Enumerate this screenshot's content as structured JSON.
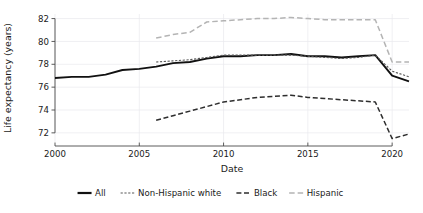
{
  "chart_data": {
    "type": "line",
    "title": "",
    "xlabel": "Date",
    "ylabel": "Life expectancy (years)",
    "xlim": [
      2000,
      2021
    ],
    "ylim": [
      71.2,
      82.4
    ],
    "xticks": [
      2000,
      2005,
      2010,
      2015,
      2020
    ],
    "xtick_labels": [
      "2000",
      "2005",
      "2010",
      "2015",
      "2020"
    ],
    "yticks": [
      72,
      74,
      76,
      78,
      80,
      82
    ],
    "ytick_labels": [
      "72",
      "74",
      "76",
      "78",
      "80",
      "82"
    ],
    "grid": "y-gridlines-light",
    "legend_position": "below-axis-centered",
    "series": [
      {
        "name": "All",
        "color": "#111111",
        "width": 1.9,
        "dash": "none",
        "x": [
          2000,
          2001,
          2002,
          2003,
          2004,
          2005,
          2006,
          2007,
          2008,
          2009,
          2010,
          2011,
          2012,
          2013,
          2014,
          2015,
          2016,
          2017,
          2018,
          2019,
          2020,
          2021
        ],
        "values": [
          76.8,
          76.9,
          76.9,
          77.1,
          77.5,
          77.6,
          77.8,
          78.1,
          78.2,
          78.5,
          78.7,
          78.7,
          78.8,
          78.8,
          78.9,
          78.7,
          78.7,
          78.6,
          78.7,
          78.8,
          77.0,
          76.5
        ]
      },
      {
        "name": "Non-Hispanic white",
        "color": "#585858",
        "width": 1.1,
        "dash": "2.2 1.6",
        "x": [
          2006,
          2007,
          2008,
          2009,
          2010,
          2011,
          2012,
          2013,
          2014,
          2015,
          2016,
          2017,
          2018,
          2019,
          2020,
          2021
        ],
        "values": [
          78.2,
          78.3,
          78.4,
          78.6,
          78.8,
          78.8,
          78.8,
          78.8,
          78.8,
          78.7,
          78.6,
          78.5,
          78.6,
          78.8,
          77.4,
          76.9
        ]
      },
      {
        "name": "Black",
        "color": "#2e2e2e",
        "width": 1.5,
        "dash": "5 2.6",
        "x": [
          2006,
          2007,
          2008,
          2009,
          2010,
          2011,
          2012,
          2013,
          2014,
          2015,
          2016,
          2017,
          2018,
          2019,
          2020,
          2021
        ],
        "values": [
          73.1,
          73.5,
          73.9,
          74.3,
          74.7,
          74.9,
          75.1,
          75.2,
          75.3,
          75.1,
          75.0,
          74.9,
          74.8,
          74.7,
          71.5,
          71.9
        ]
      },
      {
        "name": "Hispanic",
        "color": "#b4b4b4",
        "width": 1.5,
        "dash": "5.5 3",
        "x": [
          2006,
          2007,
          2008,
          2009,
          2010,
          2011,
          2012,
          2013,
          2014,
          2015,
          2016,
          2017,
          2018,
          2019,
          2020,
          2021
        ],
        "values": [
          80.3,
          80.6,
          80.8,
          81.7,
          81.8,
          81.9,
          82.0,
          82.0,
          82.1,
          82.0,
          81.9,
          81.9,
          81.9,
          81.9,
          78.2,
          78.2
        ]
      }
    ],
    "legend": [
      {
        "label": "All",
        "color": "#111111",
        "dash": "none",
        "width": 2.2
      },
      {
        "label": "Non-Hispanic white",
        "color": "#585858",
        "dash": "2.2 1.6",
        "width": 1.2
      },
      {
        "label": "Black",
        "color": "#2e2e2e",
        "dash": "5 2.6",
        "width": 1.5
      },
      {
        "label": "Hispanic",
        "color": "#b4b4b4",
        "dash": "5.5 3",
        "width": 1.5
      }
    ]
  },
  "plot_geometry": {
    "left": 55,
    "right": 409,
    "top": 14,
    "bottom": 142
  }
}
